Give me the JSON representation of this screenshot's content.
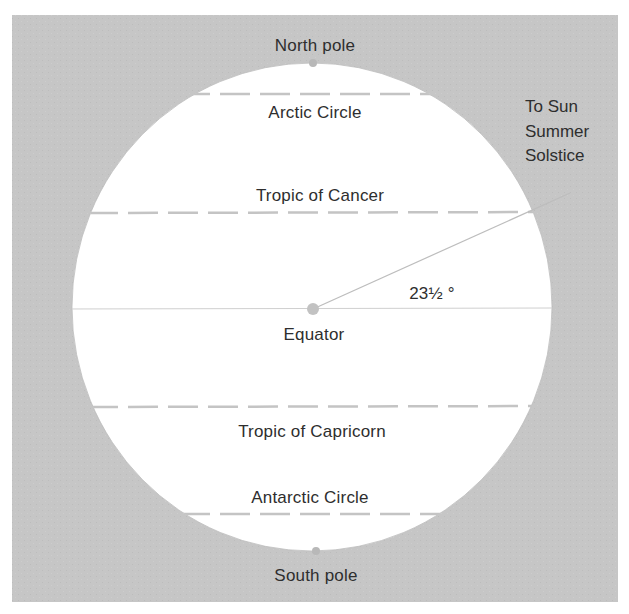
{
  "diagram": {
    "colors": {
      "background_box": "#c6c6c6",
      "globe": "#ffffff",
      "dashed_line": "#c4c4c4",
      "equator_line": "#cfcfcf",
      "sun_line": "#bdbdbd",
      "dots": "#b8b8b8",
      "text": "#2e2e2e"
    },
    "labels": {
      "north_pole": "North pole",
      "south_pole": "South pole",
      "arctic_circle": "Arctic Circle",
      "tropic_of_cancer": "Tropic of Cancer",
      "equator": "Equator",
      "tropic_of_capricorn": "Tropic of Capricorn",
      "antarctic_circle": "Antarctic Circle",
      "sun_line_1": "To Sun",
      "sun_line_2": "Summer",
      "sun_line_3": "Solstice",
      "tilt_angle": "23½ °"
    },
    "latitude_lines": [
      {
        "name": "Arctic Circle",
        "style": "dashed"
      },
      {
        "name": "Tropic of Cancer",
        "style": "dashed"
      },
      {
        "name": "Equator",
        "style": "solid"
      },
      {
        "name": "Tropic of Capricorn",
        "style": "dashed"
      },
      {
        "name": "Antarctic Circle",
        "style": "dashed"
      }
    ],
    "tilt_degrees": 23.5
  }
}
